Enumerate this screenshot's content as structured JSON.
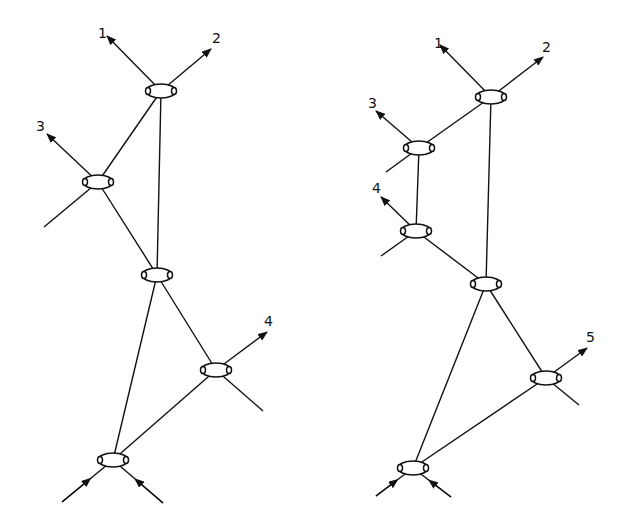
{
  "colors": {
    "ink": "#111111",
    "background": "#ffffff"
  },
  "diagrams": [
    {
      "id": "left",
      "nodes": [
        {
          "id": "A",
          "x": 161,
          "y": 91
        },
        {
          "id": "B",
          "x": 98,
          "y": 182
        },
        {
          "id": "C",
          "x": 157,
          "y": 275
        },
        {
          "id": "D",
          "x": 216,
          "y": 370
        },
        {
          "id": "E",
          "x": 113,
          "y": 460
        }
      ],
      "edges": [
        [
          "A",
          "B"
        ],
        [
          "A",
          "C"
        ],
        [
          "B",
          "C"
        ],
        [
          "C",
          "E"
        ],
        [
          "C",
          "D"
        ],
        [
          "D",
          "E"
        ]
      ],
      "outgoing": [
        {
          "from": "A",
          "x": 107,
          "y": 36,
          "label": "1",
          "lx": 98,
          "ly": 38
        },
        {
          "from": "A",
          "x": 211,
          "y": 49,
          "label": "2",
          "lx": 212,
          "ly": 43
        },
        {
          "from": "B",
          "x": 47,
          "y": 134,
          "label": "3",
          "lx": 36,
          "ly": 131
        },
        {
          "from": "D",
          "x": 267,
          "y": 332,
          "label": "4",
          "lx": 264,
          "ly": 326
        }
      ],
      "stubs": [
        {
          "from": "B",
          "x": 44,
          "y": 227
        },
        {
          "from": "D",
          "x": 263,
          "y": 411
        }
      ],
      "incoming": [
        {
          "to": "E",
          "x": 62,
          "y": 502
        },
        {
          "to": "E",
          "x": 163,
          "y": 503
        }
      ]
    },
    {
      "id": "right",
      "nodes": [
        {
          "id": "A",
          "x": 491,
          "y": 97
        },
        {
          "id": "B",
          "x": 419,
          "y": 148
        },
        {
          "id": "C",
          "x": 416,
          "y": 231
        },
        {
          "id": "D",
          "x": 486,
          "y": 284
        },
        {
          "id": "E",
          "x": 546,
          "y": 378
        },
        {
          "id": "F",
          "x": 413,
          "y": 468
        }
      ],
      "edges": [
        [
          "A",
          "B"
        ],
        [
          "A",
          "D"
        ],
        [
          "B",
          "C"
        ],
        [
          "C",
          "D"
        ],
        [
          "D",
          "F"
        ],
        [
          "D",
          "E"
        ],
        [
          "E",
          "F"
        ]
      ],
      "outgoing": [
        {
          "from": "A",
          "x": 440,
          "y": 45,
          "label": "1",
          "lx": 434,
          "ly": 48
        },
        {
          "from": "A",
          "x": 543,
          "y": 57,
          "label": "2",
          "lx": 542,
          "ly": 52
        },
        {
          "from": "B",
          "x": 376,
          "y": 111,
          "label": "3",
          "lx": 368,
          "ly": 108
        },
        {
          "from": "C",
          "x": 381,
          "y": 197,
          "label": "4",
          "lx": 372,
          "ly": 193
        },
        {
          "from": "E",
          "x": 587,
          "y": 348,
          "label": "5",
          "lx": 586,
          "ly": 342
        }
      ],
      "stubs": [
        {
          "from": "B",
          "x": 386,
          "y": 172
        },
        {
          "from": "C",
          "x": 381,
          "y": 256
        },
        {
          "from": "E",
          "x": 579,
          "y": 405
        }
      ],
      "incoming": [
        {
          "to": "F",
          "x": 376,
          "y": 496
        },
        {
          "to": "F",
          "x": 451,
          "y": 497
        }
      ]
    }
  ]
}
